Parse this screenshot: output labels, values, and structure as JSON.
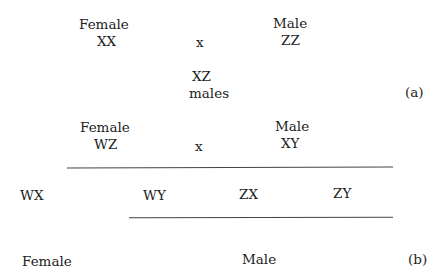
{
  "part_a": {
    "female_label": "Female",
    "female_genotype": "XX",
    "cross": "x",
    "male_label": "Male",
    "male_genotype": "ZZ",
    "offspring_genotype": "XZ",
    "offspring_label": "males",
    "panel_label": "(a)"
  },
  "part_b": {
    "female_label": "Female",
    "female_genotype": "WZ",
    "cross": "x",
    "male_label": "Male",
    "male_genotype": "XY",
    "offspring": [
      "WX",
      "WY",
      "ZX",
      "ZY"
    ],
    "female_group_label": "Female",
    "male_group_label": "Male",
    "panel_label": "(b)"
  }
}
